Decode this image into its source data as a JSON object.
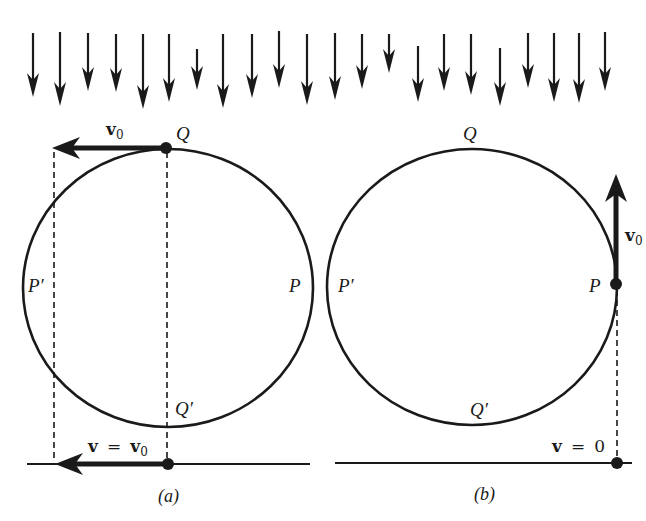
{
  "figure": {
    "colors": {
      "ink": "#1a1a1a",
      "background": "#ffffff"
    },
    "field_arrows": {
      "direction": "down",
      "items": [
        {
          "x": 33,
          "y1": 33,
          "y2": 97
        },
        {
          "x": 60,
          "y1": 32,
          "y2": 106
        },
        {
          "x": 88,
          "y1": 33,
          "y2": 91
        },
        {
          "x": 116,
          "y1": 34,
          "y2": 92
        },
        {
          "x": 143,
          "y1": 34,
          "y2": 109
        },
        {
          "x": 169,
          "y1": 34,
          "y2": 102
        },
        {
          "x": 197,
          "y1": 49,
          "y2": 90
        },
        {
          "x": 223,
          "y1": 34,
          "y2": 108
        },
        {
          "x": 252,
          "y1": 34,
          "y2": 98
        },
        {
          "x": 279,
          "y1": 31,
          "y2": 88
        },
        {
          "x": 307,
          "y1": 34,
          "y2": 105
        },
        {
          "x": 335,
          "y1": 33,
          "y2": 100
        },
        {
          "x": 362,
          "y1": 34,
          "y2": 89
        },
        {
          "x": 389,
          "y1": 34,
          "y2": 73
        },
        {
          "x": 418,
          "y1": 46,
          "y2": 102
        },
        {
          "x": 444,
          "y1": 34,
          "y2": 91
        },
        {
          "x": 471,
          "y1": 34,
          "y2": 95
        },
        {
          "x": 500,
          "y1": 48,
          "y2": 106
        },
        {
          "x": 528,
          "y1": 33,
          "y2": 88
        },
        {
          "x": 554,
          "y1": 33,
          "y2": 102
        },
        {
          "x": 579,
          "y1": 33,
          "y2": 103
        },
        {
          "x": 605,
          "y1": 32,
          "y2": 91
        }
      ]
    },
    "panel_a": {
      "caption": "(a)",
      "labels": {
        "top": "Q",
        "bottom": "Q′",
        "left": "P′",
        "right": "P"
      },
      "top_vector": {
        "symbol": "v",
        "subscript": "0"
      },
      "bottom_vector": {
        "lhs": "v",
        "eq": "=",
        "rhs_symbol": "v",
        "rhs_subscript": "0"
      }
    },
    "panel_b": {
      "caption": "(b)",
      "labels": {
        "top": "Q",
        "bottom": "Q′",
        "left": "P′",
        "right": "P"
      },
      "side_vector": {
        "symbol": "v",
        "subscript": "0"
      },
      "contact_velocity": {
        "lhs": "v",
        "eq": "=",
        "value": "0"
      }
    }
  }
}
